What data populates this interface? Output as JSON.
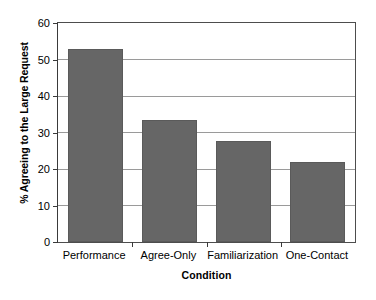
{
  "chart_data": {
    "type": "bar",
    "title": "",
    "xlabel": "Condition",
    "ylabel": "% Agreeing to the Large Request",
    "categories": [
      "Performance",
      "Agree-Only",
      "Familiarization",
      "One-Contact"
    ],
    "values": [
      52.8,
      33.3,
      27.8,
      22.0
    ],
    "ylim": [
      0,
      60
    ],
    "ytick_values": [
      0,
      10,
      20,
      30,
      40,
      50,
      60
    ],
    "ytick_labels": [
      "0",
      "10",
      "20",
      "30",
      "40",
      "50",
      "60"
    ],
    "grid": true,
    "grid_axis": "y",
    "legend": false,
    "legend_position": "none",
    "bar_color": "#666666",
    "bar_edge_color": "#5a5a5a",
    "grid_color": "#9a9a9a",
    "axis_color": "#3a3a3a",
    "background_color": "#ffffff"
  }
}
